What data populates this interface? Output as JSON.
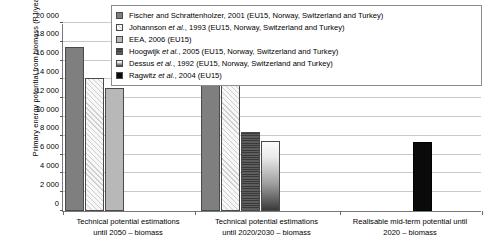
{
  "chart_data": {
    "type": "bar",
    "title": "",
    "xlabel": "",
    "ylabel": "Primary energy potential from biomass (PJ/year)",
    "ylim": [
      0,
      20000
    ],
    "ytick_step": 2000,
    "yticks": [
      "0",
      "2 000",
      "4 000",
      "6 000",
      "8 000",
      "10 000",
      "12 000",
      "14 000",
      "16 000",
      "18 000",
      "20 000"
    ],
    "grid": true,
    "legend_position": "top-right-inside",
    "categories": [
      "Technical potential estimations until 2050 – biomass",
      "Technical potential estimations until 2020/2030 – biomass",
      "Realisable mid-term potential until 2020 – biomass"
    ],
    "category_lines": [
      [
        "Technical potential estimations",
        "until 2050 – biomass"
      ],
      [
        "Technical potential estimations",
        "until 2020/2030 – biomass"
      ],
      [
        "Realisable mid-term potential until",
        "2020 – biomass"
      ]
    ],
    "series": [
      {
        "name": "Fischer and Schrattenholzer, 2001 (EU15, Norway, Switzerland and Turkey)",
        "key": "fischer",
        "values": [
          17400,
          13600,
          null
        ]
      },
      {
        "name": "Johannson et al., 1993 (EU15, Norway, Switzerland and Turkey)",
        "key": "johannson",
        "values": [
          14100,
          14200,
          null
        ]
      },
      {
        "name": "EEA, 2006 (EU15)",
        "key": "eea",
        "values": [
          13100,
          null,
          null
        ]
      },
      {
        "name": "Hoogwijk et al., 2005 (EU15, Norway, Switzerland and Turkey)",
        "key": "hoogwijk",
        "values": [
          null,
          8400,
          null
        ]
      },
      {
        "name": "Dessus et al., 1992 (EU15, Norway, Switzerland and Turkey)",
        "key": "dessus",
        "values": [
          null,
          7500,
          null
        ]
      },
      {
        "name": "Ragwitz et al., 2004 (EU15)",
        "key": "ragwitz",
        "values": [
          null,
          null,
          7300
        ]
      }
    ],
    "bars": [
      {
        "series_key": "fischer",
        "group": 0,
        "value": 17400,
        "x": 2,
        "w": 19
      },
      {
        "series_key": "johannson",
        "group": 0,
        "value": 14100,
        "x": 22,
        "w": 19
      },
      {
        "series_key": "eea",
        "group": 0,
        "value": 13100,
        "x": 42,
        "w": 19
      },
      {
        "series_key": "fischer",
        "group": 1,
        "value": 13600,
        "x": 138,
        "w": 19
      },
      {
        "series_key": "johannson",
        "group": 1,
        "value": 14200,
        "x": 158,
        "w": 19
      },
      {
        "series_key": "hoogwijk",
        "group": 1,
        "value": 8400,
        "x": 178,
        "w": 19
      },
      {
        "series_key": "dessus",
        "group": 1,
        "value": 7500,
        "x": 198,
        "w": 19
      },
      {
        "series_key": "ragwitz",
        "group": 2,
        "value": 7300,
        "x": 350,
        "w": 19
      }
    ]
  },
  "legend": {
    "entries": [
      {
        "swatch": "legend-swatch-fischer",
        "prefix": "Fischer and Schrattenholzer, ",
        "italic": "",
        "suffix": "2001 (EU15, Norway, Switzerland and Turkey)"
      },
      {
        "swatch": "legend-swatch-johannson",
        "prefix": "Johannson ",
        "italic": "et al.",
        "suffix": ", 1993 (EU15, Norway, Switzerland and Turkey)"
      },
      {
        "swatch": "legend-swatch-eea",
        "prefix": "EEA, 2006 (EU15)",
        "italic": "",
        "suffix": ""
      },
      {
        "swatch": "legend-swatch-hoogwijk",
        "prefix": "Hoogwijk ",
        "italic": "et al.",
        "suffix": ", 2005 (EU15, Norway, Switzerland and Turkey)"
      },
      {
        "swatch": "legend-swatch-dessus",
        "prefix": "Dessus ",
        "italic": "et al.",
        "suffix": ", 1992 (EU15, Norway, Switzerland and Turkey)"
      },
      {
        "swatch": "legend-swatch-ragwitz",
        "prefix": "Ragwitz ",
        "italic": "et al.",
        "suffix": ", 2004 (EU15)"
      }
    ]
  },
  "colors": {
    "fischer": "#7f7f7f",
    "johannson": "#f4f4f4",
    "eea": "#b8b8b8",
    "hoogwijk": "#4f4f4f",
    "dessus": "#bdbdbd",
    "ragwitz": "#0a0a0a",
    "grid": "#c9c9c9",
    "axis": "#7a7a7a",
    "text": "#000000"
  }
}
